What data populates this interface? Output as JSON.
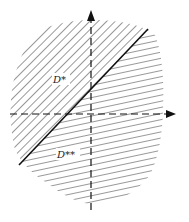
{
  "diagram": {
    "type": "region-partition",
    "regions": [
      {
        "label": "D*",
        "hatch": "diagonal",
        "position": "upper-left"
      },
      {
        "label": "D**",
        "hatch": "horizontal-slant",
        "position": "lower-right"
      }
    ],
    "axes": {
      "horizontal": "dashed-arrow-right",
      "vertical": "dashed-arrow-up"
    },
    "boundary": "diagonal solid line"
  },
  "labels": {
    "d_star": "D*",
    "d_double_star": "D**"
  },
  "colors": {
    "ink": "#222222",
    "background": "#ffffff"
  }
}
